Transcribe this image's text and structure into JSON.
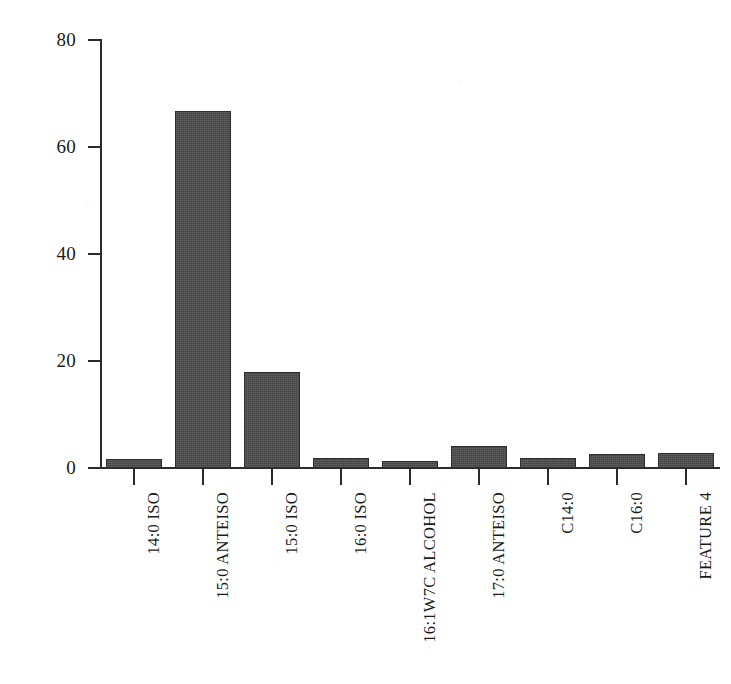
{
  "chart_data": {
    "type": "bar",
    "title": "",
    "subtitle": "",
    "xlabel": "",
    "ylabel": "脂肪酸含量/%",
    "ylim": [
      0,
      80
    ],
    "yticks": [
      0,
      20,
      40,
      60,
      80
    ],
    "ytick_labels": [
      "0",
      "20",
      "40",
      "60",
      "80"
    ],
    "grid": false,
    "legend": null,
    "bar_color": "#4a4a4a",
    "bar_edge_color": "#2e2e2e",
    "axis_color": "#2b2b2b",
    "categories": [
      "14:0 ISO",
      "15:0 ANTEISO",
      "15:0 ISO",
      "16:0 ISO",
      "16:1W7C ALCOHOL",
      "17:0 ANTEISO",
      "C14:0",
      "C16:0",
      "FEATURE 4"
    ],
    "values": [
      1.7,
      66.8,
      17.9,
      1.8,
      1.4,
      4.2,
      1.9,
      2.6,
      2.8
    ],
    "annotations": []
  }
}
